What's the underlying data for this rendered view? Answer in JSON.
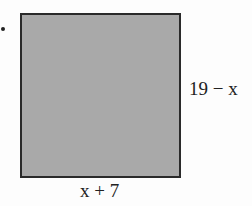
{
  "figure": {
    "shape": "square",
    "fill_color": "#a9a9a9",
    "border_color": "#2a2a2a",
    "labels": {
      "right_side": "19 − x",
      "bottom_side": "x + 7"
    }
  }
}
